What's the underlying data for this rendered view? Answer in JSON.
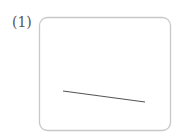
{
  "problem": {
    "label": "(1)"
  },
  "figure": {
    "box": {
      "x": 39.5,
      "y": 17.5,
      "width": 131,
      "height": 113,
      "radius": 8,
      "stroke": "#c8c8c8"
    },
    "segment": {
      "x1": 63,
      "y1": 91,
      "x2": 145,
      "y2": 102,
      "stroke": "#555555",
      "width": 1.2
    }
  }
}
